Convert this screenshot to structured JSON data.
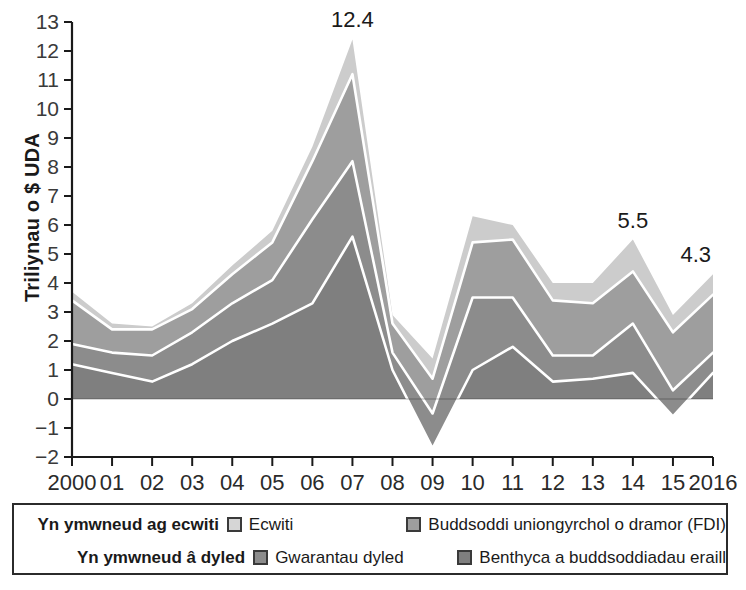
{
  "chart_data": {
    "type": "area",
    "stacked": true,
    "title": "",
    "xlabel": "",
    "ylabel": "Triliynau o $ UDA",
    "categories": [
      "2000",
      "01",
      "02",
      "03",
      "04",
      "05",
      "06",
      "07",
      "08",
      "09",
      "10",
      "11",
      "12",
      "13",
      "14",
      "15",
      "2016"
    ],
    "x_tick_labels": [
      "2000",
      "01",
      "02",
      "03",
      "04",
      "05",
      "06",
      "07",
      "08",
      "09",
      "10",
      "11",
      "12",
      "13",
      "14",
      "15",
      "2016"
    ],
    "y_tick_labels": [
      "-2",
      "-1",
      "0",
      "1",
      "2",
      "3",
      "4",
      "5",
      "6",
      "7",
      "8",
      "9",
      "10",
      "11",
      "12",
      "13"
    ],
    "ylim": [
      -2,
      13
    ],
    "xlim": [
      2000,
      2016
    ],
    "grid": false,
    "legend_position": "below-plot",
    "series": [
      {
        "name": "Benthyca a buddsoddiadau eraill",
        "color": "#7f7f7f",
        "values": [
          1.2,
          0.9,
          0.6,
          1.2,
          2.0,
          2.6,
          3.3,
          5.6,
          1.0,
          -1.7,
          1.0,
          1.8,
          0.6,
          0.7,
          0.9,
          -0.6,
          0.9
        ]
      },
      {
        "name": "Gwarantau dyled",
        "color": "#8c8c8c",
        "values": [
          0.7,
          0.7,
          0.9,
          1.1,
          1.3,
          1.5,
          2.9,
          2.6,
          0.6,
          1.2,
          2.5,
          1.7,
          0.9,
          0.8,
          1.7,
          0.9,
          0.7
        ]
      },
      {
        "name": "Buddsoddi uniongyrchol o dramor (FDI)",
        "color": "#9e9e9e",
        "values": [
          1.5,
          0.8,
          0.9,
          0.8,
          1.0,
          1.3,
          2.0,
          3.0,
          1.0,
          1.2,
          1.9,
          2.0,
          1.9,
          1.8,
          1.8,
          2.0,
          2.0
        ]
      },
      {
        "name": "Ecwiti",
        "color": "#cccccc",
        "values": [
          0.3,
          0.2,
          0.1,
          0.2,
          0.3,
          0.4,
          0.5,
          1.2,
          0.3,
          0.7,
          0.9,
          0.5,
          0.6,
          0.7,
          1.1,
          0.6,
          0.7
        ]
      }
    ],
    "totals": [
      3.7,
      2.6,
      2.5,
      3.3,
      4.6,
      5.8,
      8.7,
      12.4,
      2.9,
      1.4,
      6.3,
      6.0,
      4.0,
      4.0,
      5.5,
      2.9,
      4.3
    ],
    "annotations": [
      {
        "label": "12.4",
        "x_category": "07",
        "value": 12.4
      },
      {
        "label": "5.5",
        "x_category": "14",
        "value": 5.5
      },
      {
        "label": "4.3",
        "x_category": "2016",
        "value": 4.3
      }
    ]
  },
  "legend": {
    "rows": [
      {
        "category": "Yn ymwneud ag ecwiti",
        "left_item": {
          "label": "Ecwiti",
          "color": "#d6d6d6"
        },
        "right_item": {
          "label": "Buddsoddi uniongyrchol o dramor (FDI)",
          "color": "#9e9e9e"
        }
      },
      {
        "category": "Yn ymwneud â dyled",
        "left_item": {
          "label": "Gwarantau dyled",
          "color": "#8c8c8c"
        },
        "right_item": {
          "label": "Benthyca a buddsoddiadau eraill",
          "color": "#7f7f7f"
        }
      }
    ]
  },
  "axis": {
    "y_title": "Triliynau o $ UDA"
  }
}
